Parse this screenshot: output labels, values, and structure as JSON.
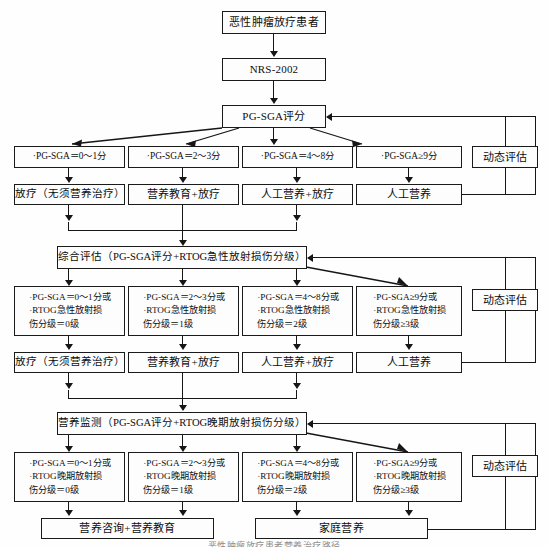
{
  "diagram": {
    "caption": "恶性肿瘤放疗患者营养治疗路径",
    "top": {
      "patient": "恶性肿瘤放疗患者",
      "screening": "NRS-2002",
      "scoring": "PG-SGA评分"
    },
    "dynamic_label": "动态评估",
    "stage1": {
      "criteria": [
        "·PG-SGA＝0～1分",
        "·PG-SGA＝2～3分",
        "·PG-SGA＝4～8分",
        "·PG-SGA≥9分"
      ],
      "treatments": [
        "放疗（无须营养治疗）",
        "营养教育+放疗",
        "人工营养+放疗",
        "人工营养"
      ]
    },
    "stage2": {
      "header": "综合评估（PG-SGA评分+RTOG急性放射损伤分级）",
      "criteria": [
        "·PG-SGA＝0～1分或\n·RTOG急性放射损\n伤分级＝0级",
        "·PG-SGA＝2～3分或\n·RTOG急性放射损\n伤分级＝1级",
        "·PG-SGA＝4～8分或\n·RTOG急性放射损\n伤分级＝2级",
        "·PG-SGA≥9分或\n·RTOG急性放射损\n伤分级≥3级"
      ],
      "treatments": [
        "放疗（无须营养治疗）",
        "营养教育+放疗",
        "人工营养+放疗",
        "人工营养"
      ]
    },
    "stage3": {
      "header": "营养监测（PG-SGA评分+RTOG晚期放射损伤分级）",
      "criteria": [
        "·PG-SGA＝0～1分或\n·RTOG晚期放射损\n伤分级＝0级",
        "·PG-SGA＝2～3分或\n·RTOG晚期放射损\n伤分级＝1级",
        "·PG-SGA＝4～8分或\n·RTOG晚期放射损\n伤分级＝2级",
        "·PG-SGA≥9分或\n·RTOG晚期放射损\n伤分级≥3级"
      ],
      "outcomes": [
        "营养咨询+营养教育",
        "家庭营养"
      ]
    }
  }
}
